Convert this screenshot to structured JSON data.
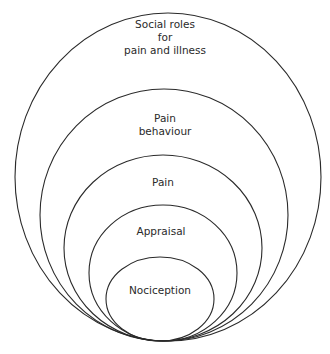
{
  "diagram": {
    "type": "nested-ellipses",
    "stroke_color": "#2a2a2a",
    "background": "#ffffff",
    "layers": [
      {
        "name": "social-roles",
        "lines": [
          "Social roles",
          "for",
          "pain and illness"
        ],
        "ellipse": {
          "cx": 168,
          "cy": 177,
          "rx": 153,
          "ry": 164
        },
        "text_y": [
          28,
          41,
          54
        ]
      },
      {
        "name": "pain-behaviour",
        "lines": [
          "Pain",
          "behaviour"
        ],
        "ellipse": {
          "cx": 164,
          "cy": 215,
          "rx": 124,
          "ry": 126
        },
        "text_y": [
          122,
          135
        ]
      },
      {
        "name": "pain",
        "lines": [
          "Pain"
        ],
        "ellipse": {
          "cx": 163,
          "cy": 248,
          "rx": 99,
          "ry": 93
        },
        "text_y": [
          186
        ]
      },
      {
        "name": "appraisal",
        "lines": [
          "Appraisal"
        ],
        "ellipse": {
          "cx": 163,
          "cy": 273,
          "rx": 74,
          "ry": 68
        },
        "text_y": [
          235
        ]
      },
      {
        "name": "nociception",
        "lines": [
          "Nociception"
        ],
        "ellipse": {
          "cx": 160,
          "cy": 299,
          "rx": 54,
          "ry": 42
        },
        "text_y": [
          294
        ]
      }
    ]
  }
}
